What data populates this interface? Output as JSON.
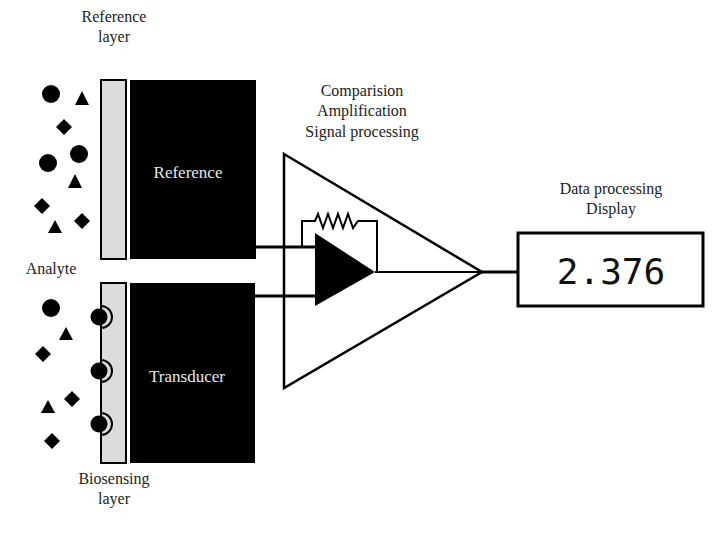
{
  "diagram": {
    "type": "biosensor-schematic",
    "labels": {
      "reference_layer_line1": "Reference",
      "reference_layer_line2": "layer",
      "reference_block": "Reference",
      "analyte": "Analyte",
      "transducer_block": "Transducer",
      "biosensing_layer_line1": "Biosensing",
      "biosensing_layer_line2": "layer",
      "processing_line1": "Comparision",
      "processing_line2": "Amplification",
      "processing_line3": "Signal processing",
      "output_line1": "Data processing",
      "output_line2": "Display"
    },
    "display_value": "2.376",
    "colors": {
      "block_fill": "#000000",
      "layer_fill": "#dcdcdc",
      "stroke": "#000000",
      "text_dark": "#222222",
      "text_on_block": "#e8e8e8"
    },
    "analyte_shapes_top": [
      {
        "shape": "circle",
        "x": 51,
        "y": 94
      },
      {
        "shape": "triangle",
        "x": 82,
        "y": 99
      },
      {
        "shape": "diamond",
        "x": 64,
        "y": 127
      },
      {
        "shape": "circle",
        "x": 79,
        "y": 154
      },
      {
        "shape": "circle",
        "x": 48,
        "y": 163
      },
      {
        "shape": "triangle",
        "x": 75,
        "y": 182
      },
      {
        "shape": "diamond",
        "x": 42,
        "y": 206
      },
      {
        "shape": "triangle",
        "x": 55,
        "y": 227
      },
      {
        "shape": "diamond",
        "x": 82,
        "y": 221
      }
    ],
    "analyte_shapes_bottom": [
      {
        "shape": "circle",
        "x": 51,
        "y": 308
      },
      {
        "shape": "triangle",
        "x": 66,
        "y": 334
      },
      {
        "shape": "diamond",
        "x": 43,
        "y": 354
      },
      {
        "shape": "diamond",
        "x": 72,
        "y": 399
      },
      {
        "shape": "triangle",
        "x": 48,
        "y": 407
      },
      {
        "shape": "diamond",
        "x": 52,
        "y": 441
      }
    ],
    "bound_receptors": [
      {
        "x": 100,
        "y": 317
      },
      {
        "x": 100,
        "y": 371
      },
      {
        "x": 100,
        "y": 424
      }
    ]
  }
}
